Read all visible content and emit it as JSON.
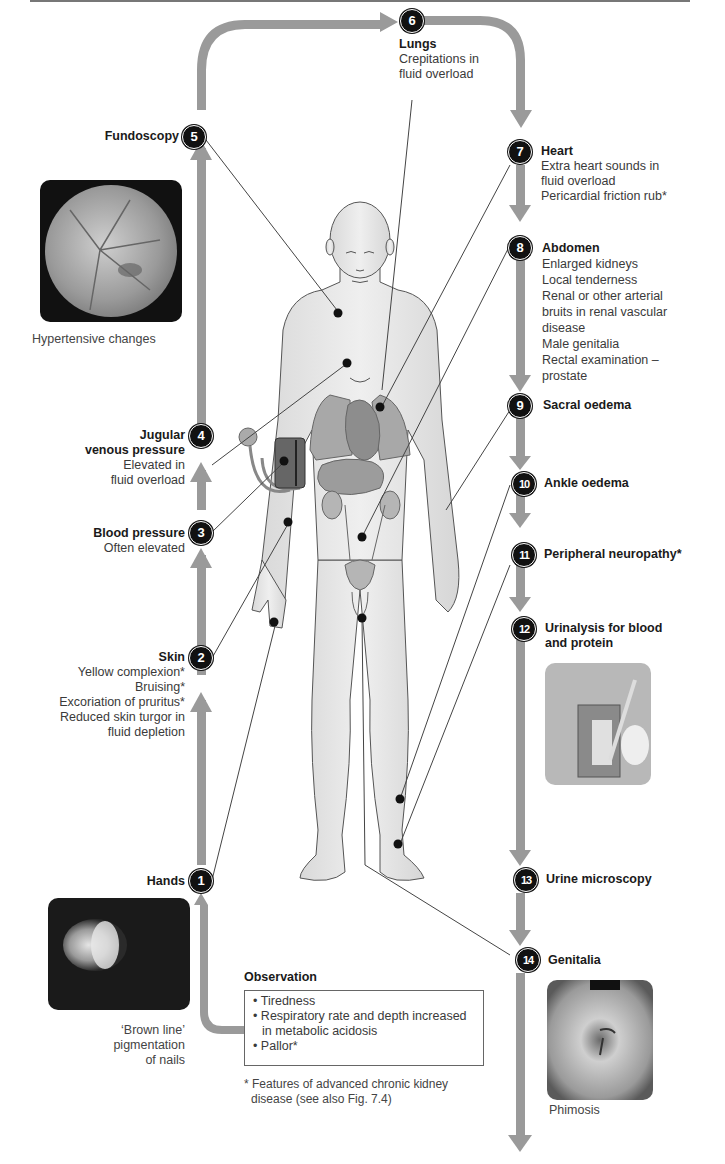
{
  "figure": {
    "type": "clinical examination flow diagram"
  },
  "steps": [
    {
      "num": "1",
      "title": "Hands",
      "details": []
    },
    {
      "num": "2",
      "title": "Skin",
      "details": [
        "Yellow complexion*",
        "Bruising*",
        "Excoriation of pruritus*",
        "Reduced skin turgor in",
        "fluid depletion"
      ]
    },
    {
      "num": "3",
      "title": "Blood pressure",
      "details": [
        "Often elevated"
      ]
    },
    {
      "num": "4",
      "title_lines": [
        "Jugular",
        "venous pressure"
      ],
      "details": [
        "Elevated in",
        "fluid overload"
      ]
    },
    {
      "num": "5",
      "title": "Fundoscopy",
      "details": []
    },
    {
      "num": "6",
      "title": "Lungs",
      "details": [
        "Crepitations in",
        "fluid overload"
      ]
    },
    {
      "num": "7",
      "title": "Heart",
      "details": [
        "Extra heart sounds in",
        "fluid overload",
        "Pericardial friction rub*"
      ]
    },
    {
      "num": "8",
      "title": "Abdomen",
      "details": [
        "Enlarged kidneys",
        "Local tenderness",
        "Renal or other arterial",
        "bruits in renal vascular",
        "disease",
        "Male genitalia",
        "Rectal examination –",
        "prostate"
      ]
    },
    {
      "num": "9",
      "title": "Sacral oedema",
      "details": []
    },
    {
      "num": "10",
      "title": "Ankle oedema",
      "details": []
    },
    {
      "num": "11",
      "title": "Peripheral neuropathy*",
      "details": []
    },
    {
      "num": "12",
      "title_lines": [
        "Urinalysis for blood",
        "and protein"
      ],
      "details": []
    },
    {
      "num": "13",
      "title": "Urine microscopy",
      "details": []
    },
    {
      "num": "14",
      "title": "Genitalia",
      "details": []
    }
  ],
  "photos": {
    "fundus_caption": "Hypertensive changes",
    "nail_caption": [
      "‘Brown line’",
      "pigmentation",
      "of nails"
    ],
    "urine_caption": "",
    "phimosis_caption": "Phimosis"
  },
  "observation": {
    "title": "Observation",
    "items": [
      "Tiredness",
      "Respiratory rate and depth increased in metabolic acidosis",
      "Pallor*"
    ]
  },
  "footnote": [
    "* Features of advanced chronic kidney",
    "disease (see also Fig. 7.4)"
  ],
  "colors": {
    "arrow": "#9a9a9a",
    "badge": "#111111",
    "body_fill": "#e6e6e6",
    "organ_fill": "#a8a8a8"
  }
}
